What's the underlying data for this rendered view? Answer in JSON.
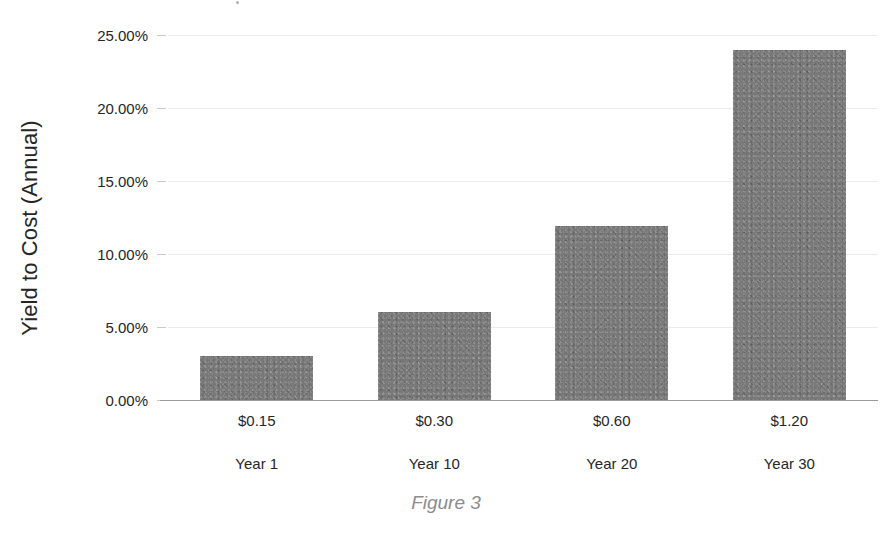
{
  "caption": "Figure 3",
  "colors": {
    "bar_fill": "#787878",
    "gridline": "#ebebeb",
    "axis_line": "#9a9a9a",
    "text": "#262626",
    "caption_text": "#8c8c8c"
  },
  "chart_data": {
    "type": "bar",
    "title": "",
    "xlabel": "",
    "ylabel": "Yield to Cost (Annual)",
    "categories": [
      "$0.15",
      "$0.30",
      "$0.60",
      "$1.20"
    ],
    "secondary_categories": [
      "Year 1",
      "Year 10",
      "Year 20",
      "Year 30"
    ],
    "values": [
      3.0,
      6.0,
      11.9,
      24.0
    ],
    "value_labels": [
      "3.00%",
      "6.00%",
      "11.90%",
      "24.00%"
    ],
    "ylim": [
      0,
      25
    ],
    "ytick_values": [
      0,
      5,
      10,
      15,
      20,
      25
    ],
    "ytick_labels": [
      "0.00%",
      "5.00%",
      "10.00%",
      "15.00%",
      "20.00%",
      "25.00%"
    ],
    "grid": true,
    "grid_axis": "y",
    "legend": false,
    "legend_position": "none",
    "series": [
      {
        "name": "Yield to Cost (Annual)",
        "values": [
          3.0,
          6.0,
          11.9,
          24.0
        ],
        "color": "#787878"
      }
    ]
  }
}
